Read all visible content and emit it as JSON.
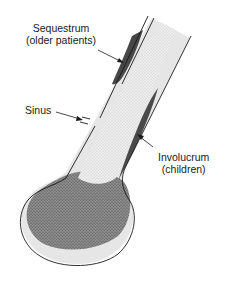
{
  "diagram": {
    "colors": {
      "background": "#ffffff",
      "outline": "#1a1a1a",
      "cortex": "#e6e6e6",
      "medulla_stipple": "#f2f2f2",
      "dark_region": "#4a4a4a",
      "epiphysis_stipple": "#8a8a8a"
    },
    "labels": {
      "sequestrum": {
        "line1": "Sequestrum",
        "line2": "(older patients)"
      },
      "sinus": {
        "line1": "Sinus"
      },
      "involucrum": {
        "line1": "Involucrum",
        "line2": "(children)"
      }
    }
  }
}
